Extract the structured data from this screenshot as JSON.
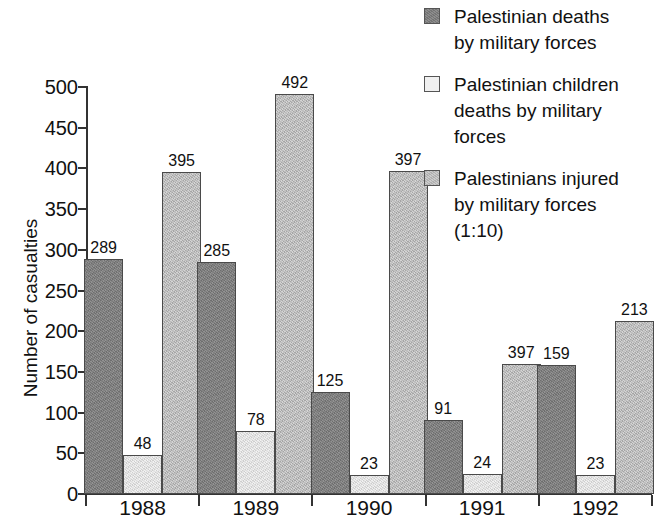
{
  "chart_data": {
    "type": "bar",
    "title": "",
    "subtitle": "",
    "xlabel": "",
    "ylabel": "Number of casualties",
    "categories": [
      "1988",
      "1989",
      "1990",
      "1991",
      "1992"
    ],
    "ylim": [
      0,
      500
    ],
    "ytick_values": [
      0,
      50,
      100,
      150,
      200,
      250,
      300,
      350,
      400,
      450,
      500
    ],
    "ytick_labels": [
      "0",
      "50",
      "100",
      "150",
      "200",
      "250",
      "300",
      "350",
      "400",
      "450",
      "500"
    ],
    "grid": false,
    "legend_position": "right",
    "series": [
      {
        "name": "Palestinian deaths by military forces",
        "color": "#7d7d7d",
        "values": [
          289,
          285,
          125,
          91,
          159
        ],
        "labels": [
          "289",
          "285",
          "125",
          "91",
          "159"
        ],
        "plotted_heights": [
          289,
          285,
          125,
          91,
          159
        ]
      },
      {
        "name": "Palestinian children deaths by military forces",
        "color": "#e2e2e2",
        "values": [
          48,
          78,
          23,
          24,
          23
        ],
        "labels": [
          "48",
          "78",
          "23",
          "24",
          "23"
        ],
        "plotted_heights": [
          48,
          78,
          23,
          24,
          23
        ]
      },
      {
        "name": "Palestinians injured by military forces (1:10)",
        "color": "#bdbdbd",
        "values": [
          395,
          492,
          397,
          397,
          213
        ],
        "labels": [
          "395",
          "492",
          "397",
          "397",
          "213"
        ],
        "plotted_heights": [
          395,
          492,
          397,
          160,
          213
        ]
      }
    ]
  },
  "legend": {
    "items": [
      {
        "swatch": "dark-gray-swatch",
        "text": "Palestinian deaths\nby military forces"
      },
      {
        "swatch": "light-gray-swatch",
        "text": "Palestinian children\ndeaths by military\nforces"
      },
      {
        "swatch": "medium-gray-swatch",
        "text": "Palestinians injured\nby military forces\n(1:10)"
      }
    ]
  },
  "colors": {
    "series_deaths": "#7d7d7d",
    "series_children_deaths": "#e2e2e2",
    "series_injured": "#bdbdbd",
    "axis": "#333333",
    "text": "#111111",
    "background": "#ffffff"
  }
}
